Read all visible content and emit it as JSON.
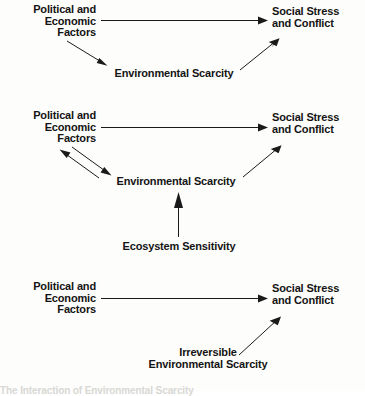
{
  "figure": {
    "background_color": "#fdfdfb",
    "ink_color": "#141414",
    "caption_clipped": "The Interaction of Environmental Scarcity"
  },
  "panels": [
    {
      "id": "panel-1",
      "nodes": {
        "source": "Political and\nEconomic\nFactors",
        "source_lines": [
          "Political and",
          "Economic",
          "Factors"
        ],
        "outcome_lines": [
          "Social Stress",
          "and Conflict"
        ],
        "middle": "Environmental Scarcity"
      },
      "edges": [
        {
          "from": "Political and Economic Factors",
          "to": "Social Stress and Conflict",
          "direction": "right"
        },
        {
          "from": "Political and Economic Factors",
          "to": "Environmental Scarcity",
          "direction": "down-right"
        },
        {
          "from": "Environmental Scarcity",
          "to": "Social Stress and Conflict",
          "direction": "up-right"
        }
      ]
    },
    {
      "id": "panel-2",
      "nodes": {
        "source_lines": [
          "Political and",
          "Economic",
          "Factors"
        ],
        "outcome_lines": [
          "Social Stress",
          "and Conflict"
        ],
        "middle": "Environmental Scarcity",
        "driver": "Ecosystem Sensitivity"
      },
      "edges": [
        {
          "from": "Political and Economic Factors",
          "to": "Social Stress and Conflict",
          "direction": "right"
        },
        {
          "from": "Political and Economic Factors",
          "to": "Environmental Scarcity",
          "direction": "down-right"
        },
        {
          "from": "Environmental Scarcity",
          "to": "Political and Economic Factors",
          "direction": "up-left"
        },
        {
          "from": "Environmental Scarcity",
          "to": "Social Stress and Conflict",
          "direction": "up-right"
        },
        {
          "from": "Ecosystem Sensitivity",
          "to": "Environmental Scarcity",
          "direction": "up"
        }
      ]
    },
    {
      "id": "panel-3",
      "nodes": {
        "source_lines": [
          "Political and",
          "Economic",
          "Factors"
        ],
        "outcome_lines": [
          "Social Stress",
          "and Conflict"
        ],
        "middle_lines": [
          "Irreversible",
          "Environmental Scarcity"
        ]
      },
      "edges": [
        {
          "from": "Political and Economic Factors",
          "to": "Social Stress and Conflict",
          "direction": "right"
        },
        {
          "from": "Irreversible Environmental Scarcity",
          "to": "Social Stress and Conflict",
          "direction": "up-right"
        }
      ]
    }
  ]
}
